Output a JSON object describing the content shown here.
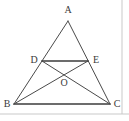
{
  "figure": {
    "kind": "geometry-diagram",
    "caption": "",
    "canvas": {
      "width": 129,
      "height": 121
    },
    "background_color": "#ffffff",
    "stroke_color": "#4a4a4a",
    "heavy_stroke_color": "#3c3c3c",
    "label_color": "#3a3a3a",
    "stroke_width": 1,
    "points": {
      "A": {
        "label": "A",
        "x": 68,
        "y": 21,
        "label_x": 68,
        "label_y": 10
      },
      "B": {
        "label": "B",
        "x": 14,
        "y": 104,
        "label_x": 7,
        "label_y": 104
      },
      "C": {
        "label": "C",
        "x": 110,
        "y": 104,
        "label_x": 117,
        "label_y": 104
      },
      "D": {
        "label": "D",
        "x": 42,
        "y": 61,
        "label_x": 34,
        "label_y": 60
      },
      "E": {
        "label": "E",
        "x": 88,
        "y": 61,
        "label_x": 96,
        "label_y": 60
      },
      "O": {
        "label": "O",
        "x": 64,
        "y": 75,
        "label_x": 64,
        "label_y": 83
      }
    },
    "segments": [
      {
        "name": "side-AB",
        "from": "A",
        "to": "B",
        "weight": "thin"
      },
      {
        "name": "side-AC",
        "from": "A",
        "to": "C",
        "weight": "thin"
      },
      {
        "name": "side-BC",
        "from": "B",
        "to": "C",
        "weight": "heavy"
      },
      {
        "name": "segment-DE",
        "from": "D",
        "to": "E",
        "weight": "heavy"
      },
      {
        "name": "cevian-BE",
        "from": "B",
        "to": "E",
        "weight": "thin"
      },
      {
        "name": "cevian-CD",
        "from": "C",
        "to": "D",
        "weight": "thin"
      }
    ],
    "border": {
      "right_line": {
        "x": 122,
        "y1": 0,
        "y2": 114
      },
      "bottom_line": {
        "y": 114,
        "x1": 0,
        "x2": 129
      },
      "color": "#c9c9c9"
    }
  }
}
